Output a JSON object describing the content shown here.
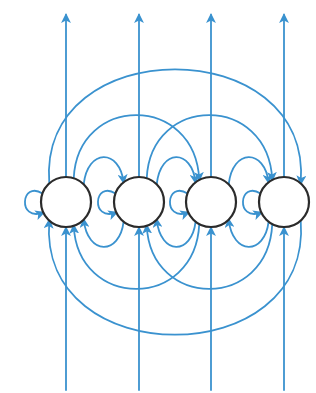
{
  "diagram": {
    "type": "state-transition-graph",
    "colors": {
      "edge": "#3a92cf",
      "node_stroke": "#2b2b2b",
      "node_fill": "#ffffff",
      "background": "#ffffff"
    },
    "node_radius": 25,
    "nodes": [
      {
        "id": "n1",
        "cx": 66,
        "cy": 202
      },
      {
        "id": "n2",
        "cx": 139,
        "cy": 202
      },
      {
        "id": "n3",
        "cx": 211,
        "cy": 202
      },
      {
        "id": "n4",
        "cx": 284,
        "cy": 202
      }
    ],
    "input_lines": [
      {
        "to": "n1",
        "x": 66,
        "y_start": 390,
        "y_end": 228
      },
      {
        "to": "n2",
        "x": 139,
        "y_start": 390,
        "y_end": 228
      },
      {
        "to": "n3",
        "x": 211,
        "y_start": 390,
        "y_end": 228
      },
      {
        "to": "n4",
        "x": 284,
        "y_start": 390,
        "y_end": 228
      }
    ],
    "output_lines": [
      {
        "from": "n1",
        "x": 66,
        "y_start": 177,
        "y_end": 15
      },
      {
        "from": "n2",
        "x": 139,
        "y_start": 177,
        "y_end": 15
      },
      {
        "from": "n3",
        "x": 211,
        "y_start": 177,
        "y_end": 15
      },
      {
        "from": "n4",
        "x": 284,
        "y_start": 177,
        "y_end": 15
      }
    ],
    "self_loops": [
      {
        "node": "n1",
        "side": "left"
      },
      {
        "node": "n2",
        "side": "left"
      },
      {
        "node": "n3",
        "side": "left"
      },
      {
        "node": "n4",
        "side": "left"
      }
    ],
    "forward_edges": [
      {
        "from": "n1",
        "to": "n2",
        "peak_y": 157
      },
      {
        "from": "n2",
        "to": "n3",
        "peak_y": 157
      },
      {
        "from": "n3",
        "to": "n4",
        "peak_y": 157
      },
      {
        "from": "n1",
        "to": "n3",
        "peak_y": 115
      },
      {
        "from": "n2",
        "to": "n4",
        "peak_y": 115
      },
      {
        "from": "n1",
        "to": "n4",
        "peak_y": 69
      }
    ],
    "backward_edges": [
      {
        "from": "n2",
        "to": "n1",
        "trough_y": 247
      },
      {
        "from": "n3",
        "to": "n2",
        "trough_y": 247
      },
      {
        "from": "n4",
        "to": "n3",
        "trough_y": 247
      },
      {
        "from": "n3",
        "to": "n1",
        "trough_y": 289
      },
      {
        "from": "n4",
        "to": "n2",
        "trough_y": 289
      },
      {
        "from": "n4",
        "to": "n1",
        "trough_y": 335
      }
    ]
  }
}
